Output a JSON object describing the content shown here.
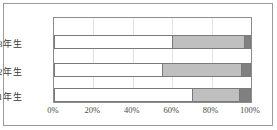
{
  "chart_data": {
    "type": "bar",
    "orientation": "horizontal",
    "stacked": true,
    "normalized": true,
    "title": "",
    "subtitle": "",
    "xlabel": "",
    "ylabel": "",
    "xlim": [
      0,
      100
    ],
    "x_tick_labels": [
      "0%",
      "20%",
      "40%",
      "60%",
      "80%",
      "100%"
    ],
    "x_tick_values": [
      0,
      20,
      40,
      60,
      80,
      100
    ],
    "grid": true,
    "grid_axis": "x",
    "legend": false,
    "legend_position": "none",
    "categories": [
      "3年生",
      "2年生",
      "1年生"
    ],
    "series": [
      {
        "name": "series-1",
        "color": "#ffffff",
        "values": [
          60,
          55,
          70
        ]
      },
      {
        "name": "series-2",
        "color": "#bfbfbf",
        "values": [
          36.5,
          40,
          24
        ]
      },
      {
        "name": "series-3",
        "color": "#808080",
        "values": [
          3.5,
          5,
          6
        ]
      }
    ],
    "colors": {
      "segment_1": "#ffffff",
      "segment_2": "#bfbfbf",
      "segment_3": "#808080",
      "border": "#7a7a7a",
      "gridline": "#e2e2e2",
      "frame": "#9a9a9a",
      "text": "#3a3a3a"
    }
  }
}
